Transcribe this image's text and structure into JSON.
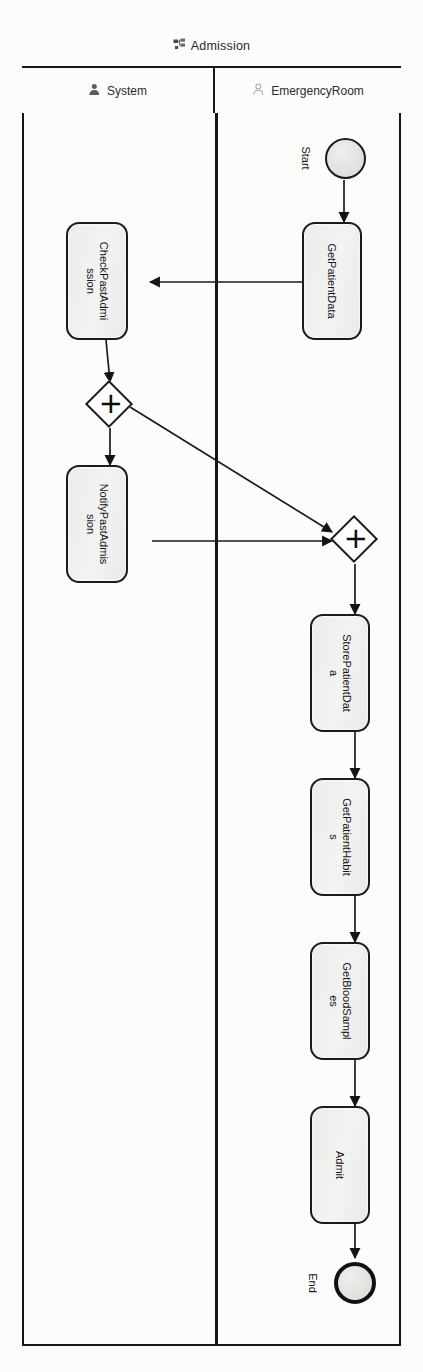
{
  "pool": {
    "title": "Admission",
    "icon": "process-diagram-icon"
  },
  "lanes": [
    {
      "id": "system",
      "label": "System",
      "icon": "user-filled-icon"
    },
    {
      "id": "emergencyroom",
      "label": "EmergencyRoom",
      "icon": "user-outline-icon"
    }
  ],
  "events": [
    {
      "id": "start",
      "type": "start-event",
      "label": "Start",
      "lane": "emergencyroom"
    },
    {
      "id": "end",
      "type": "end-event",
      "label": "End",
      "lane": "emergencyroom"
    }
  ],
  "tasks": [
    {
      "id": "getpatientdata",
      "label": "GetPatientData",
      "lane": "emergencyroom"
    },
    {
      "id": "checkpastadmission",
      "label": "CheckPastAdmission",
      "lane": "system"
    },
    {
      "id": "notifypastadmission",
      "label": "NotifyPastAdmission",
      "lane": "system"
    },
    {
      "id": "storepatientdata",
      "label": "StorePatientData",
      "lane": "emergencyroom"
    },
    {
      "id": "getpatienthabits",
      "label": "GetPatientHabits",
      "lane": "emergencyroom"
    },
    {
      "id": "getbloodsamples",
      "label": "GetBloodSamples",
      "lane": "emergencyroom"
    },
    {
      "id": "admit",
      "label": "Admit",
      "lane": "emergencyroom"
    }
  ],
  "gateways": [
    {
      "id": "gw-split",
      "type": "exclusive-gateway",
      "symbol": "✕",
      "lane": "system"
    },
    {
      "id": "gw-merge",
      "type": "exclusive-gateway",
      "symbol": "✕",
      "lane": "emergencyroom"
    }
  ],
  "flows": [
    {
      "from": "start",
      "to": "getpatientdata"
    },
    {
      "from": "getpatientdata",
      "to": "checkpastadmission"
    },
    {
      "from": "checkpastadmission",
      "to": "gw-split"
    },
    {
      "from": "gw-split",
      "to": "notifypastadmission"
    },
    {
      "from": "gw-split",
      "to": "gw-merge"
    },
    {
      "from": "notifypastadmission",
      "to": "gw-merge"
    },
    {
      "from": "gw-merge",
      "to": "storepatientdata"
    },
    {
      "from": "storepatientdata",
      "to": "getpatienthabits"
    },
    {
      "from": "getpatienthabits",
      "to": "getbloodsamples"
    },
    {
      "from": "getbloodsamples",
      "to": "admit"
    },
    {
      "from": "admit",
      "to": "end"
    }
  ],
  "colors": {
    "stroke": "#1b1b1b",
    "shape_fill": "#eeeeec",
    "canvas": "#fbfbfa"
  }
}
